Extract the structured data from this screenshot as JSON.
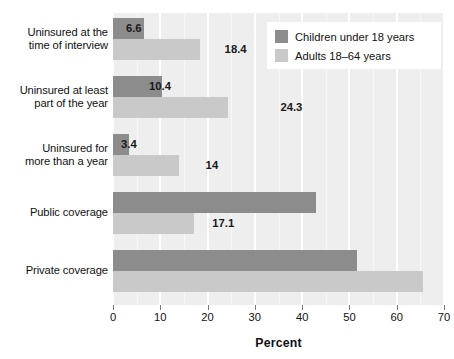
{
  "chart_data": {
    "type": "bar",
    "orientation": "horizontal",
    "title": "",
    "xlabel": "Percent",
    "ylabel": "",
    "xlim": [
      0,
      70
    ],
    "xticks": [
      0,
      10,
      20,
      30,
      40,
      50,
      60,
      70
    ],
    "xtick_labels": [
      "0",
      "10",
      "20",
      "30",
      "40",
      "50",
      "60",
      "70"
    ],
    "grid": true,
    "legend_position": "upper right",
    "categories": [
      "Uninsured at the time of interview",
      "Uninsured at least part of the year",
      "Uninsured for more than a year",
      "Public coverage",
      "Private coverage"
    ],
    "category_lines": [
      [
        "Uninsured at the",
        "time of interview"
      ],
      [
        "Uninsured at least",
        "part of the year"
      ],
      [
        "Uninsured for",
        "more than a year"
      ],
      [
        "Public coverage"
      ],
      [
        "Private coverage"
      ]
    ],
    "series": [
      {
        "name": "Children under 18 years",
        "color": "#8c8c8c",
        "values": [
          6.6,
          10.4,
          3.4,
          43,
          51.7
        ],
        "labels": [
          "6.6",
          "10.4",
          "3.4",
          "43",
          "51.7"
        ]
      },
      {
        "name": "Adults 18–64 years",
        "color": "#c9c9c9",
        "values": [
          18.4,
          24.3,
          14,
          17.1,
          65.6
        ],
        "labels": [
          "18.4",
          "24.3",
          "14",
          "17.1",
          "65.6"
        ]
      }
    ]
  },
  "legend": {
    "entries": [
      {
        "label": "Children under 18 years",
        "color": "#8c8c8c"
      },
      {
        "label": "Adults 18–64 years",
        "color": "#c9c9c9"
      }
    ]
  },
  "axis": {
    "title": "Percent",
    "ticks": [
      "0",
      "10",
      "20",
      "30",
      "40",
      "50",
      "60",
      "70"
    ]
  },
  "colors": {
    "plot_background": "#eeeeee",
    "gridline": "#ffffff",
    "series_dark": "#8c8c8c",
    "series_light": "#c9c9c9",
    "text": "#111111"
  }
}
